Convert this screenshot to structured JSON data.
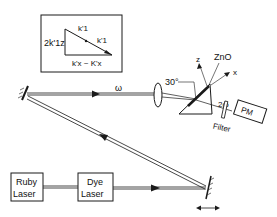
{
  "inset": {
    "labels": {
      "left": "2k'1z",
      "top1": "k'1",
      "top2": "k'1",
      "bottom": "k'x ~ K'x"
    }
  },
  "beam_labels": {
    "omega": "ω",
    "two_omega": "2ω"
  },
  "crystal": {
    "angle": "30°",
    "axis_z": "z",
    "axis_x": "x",
    "material": "ZnO"
  },
  "components": {
    "filter": "Filter",
    "pm": "PM",
    "ruby_line1": "Ruby",
    "ruby_line2": "Laser",
    "dye_line1": "Dye",
    "dye_line2": "Laser"
  },
  "colors": {
    "ink": "#1a1a1a",
    "background": "#ffffff"
  }
}
